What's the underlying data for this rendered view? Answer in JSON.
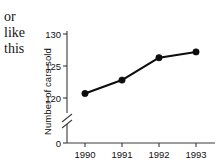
{
  "annotation": {
    "line1": "or",
    "line2": "like",
    "line3": "this"
  },
  "chart_data": {
    "type": "line",
    "title": "",
    "xlabel": "",
    "ylabel": "Number of cars sold",
    "categories": [
      "1990",
      "1991",
      "1992",
      "1993"
    ],
    "values": [
      120.7,
      122.8,
      126.3,
      127.2
    ],
    "series": [
      {
        "name": "Number of cars sold",
        "values": [
          120.7,
          122.8,
          126.3,
          127.2
        ]
      }
    ],
    "ytick_labels": [
      "130",
      "125",
      "120",
      "0"
    ],
    "ytick_values": [
      130,
      125,
      120,
      0
    ],
    "xtick_labels": [
      "1990",
      "1991",
      "1992",
      "1993"
    ],
    "ylim": [
      120,
      130
    ],
    "axis_break": true,
    "axis_break_label": "0",
    "grid": false,
    "legend": "none",
    "marker": "filled-circle",
    "line_color": "#0d0d0d",
    "marker_color": "#0d0d0d",
    "axis_color": "#3a3a3a",
    "background_color": "#ffffff"
  }
}
